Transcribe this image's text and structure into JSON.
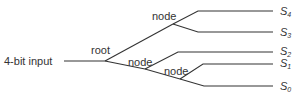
{
  "diagram": {
    "input_label": "4-bit input",
    "nodes": {
      "root": "root",
      "node1": "node",
      "node2": "node",
      "node3": "node"
    },
    "outputs": [
      {
        "name": "S",
        "sub": "4"
      },
      {
        "name": "S",
        "sub": "3"
      },
      {
        "name": "S",
        "sub": "2"
      },
      {
        "name": "S",
        "sub": "1"
      },
      {
        "name": "S",
        "sub": "0"
      }
    ]
  }
}
